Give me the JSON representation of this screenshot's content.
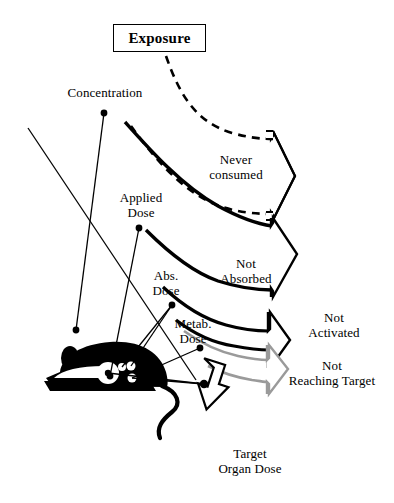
{
  "figure": {
    "title_box": {
      "label": "Exposure"
    },
    "labels": {
      "concentration": "Concentration",
      "applied_dose": "Applied\nDose",
      "abs_dose": "Abs.\nDose",
      "metab_dose": "Metab.\nDose",
      "never_consumed": "Never\nconsumed",
      "not_absorbed": "Not\nAbsorbed",
      "not_activated": "Not\nActivated",
      "not_reaching_target": "Not\nReaching Target",
      "target_organ_dose": "Target\nOrgan Dose"
    },
    "colors": {
      "stroke": "#000000",
      "loss_arrow_gray": "#9a9a9a",
      "background": "#ffffff",
      "animal_fill": "#000000"
    },
    "flow_stages": [
      {
        "name": "Exposure",
        "loss": "Never consumed",
        "loss_style": "dashed"
      },
      {
        "name": "Applied Dose",
        "loss": "Not Absorbed",
        "loss_style": "solid-black"
      },
      {
        "name": "Abs. Dose",
        "loss": "Not Activated",
        "loss_style": "solid-black"
      },
      {
        "name": "Metab. Dose",
        "loss": "Not Reaching Target",
        "loss_style": "solid-gray"
      },
      {
        "name": "Target Organ Dose",
        "loss": null,
        "loss_style": null
      }
    ],
    "graphic_elements": {
      "animal_silhouette": "mouse-silhouette",
      "down_arrow": "target-organ-dose-arrow"
    }
  }
}
